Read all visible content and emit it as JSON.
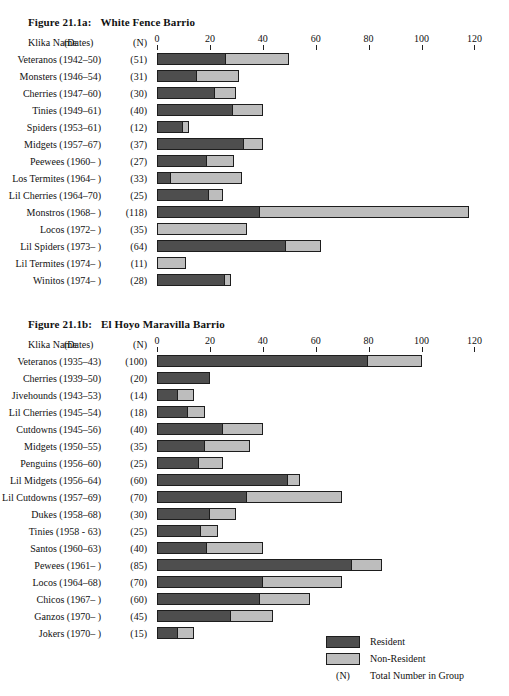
{
  "legend": {
    "resident_label": "Resident",
    "nonresident_label": "Non-Resident",
    "n_key": "(N)",
    "n_label": "Total Number in Group",
    "resident_color": "#4e4e4e",
    "nonresident_color": "#bdbdbd"
  },
  "columns": {
    "name": "Klika Name",
    "dates": "(Dates)",
    "n": "(N)"
  },
  "axis": {
    "ticks": [
      0,
      20,
      40,
      60,
      80,
      100,
      120
    ],
    "min": 0,
    "max": 130
  },
  "chart_data": [
    {
      "type": "bar",
      "orientation": "horizontal",
      "stacked": true,
      "title": "Figure 21.1a:   White Fence Barrio",
      "title_number": "Figure 21.1a:",
      "title_text": "White Fence Barrio",
      "xlabel": "",
      "ylabel": "Klika Name",
      "xlim": [
        0,
        130
      ],
      "xticks": [
        0,
        20,
        40,
        60,
        80,
        100,
        120
      ],
      "grid": false,
      "legend_position": "bottom-right",
      "series": [
        {
          "name": "Resident",
          "color": "#4e4e4e",
          "values": [
            26,
            15,
            22,
            29,
            10,
            33,
            19,
            5,
            20,
            39,
            0,
            49,
            0,
            26
          ]
        },
        {
          "name": "Non-Resident",
          "color": "#bdbdbd",
          "values": [
            24,
            16,
            8,
            11,
            2,
            7,
            10,
            27,
            5,
            79,
            34,
            13,
            11,
            2
          ]
        }
      ],
      "rows": [
        {
          "name": "Veteranos",
          "dates": "(1942–50)",
          "n": "(51)",
          "resident": 26,
          "nonresident": 24
        },
        {
          "name": "Monsters",
          "dates": "(1946–54)",
          "n": "(31)",
          "resident": 15,
          "nonresident": 16
        },
        {
          "name": "Cherries",
          "dates": "(1947–60)",
          "n": "(30)",
          "resident": 22,
          "nonresident": 8
        },
        {
          "name": "Tinies",
          "dates": "(1949–61)",
          "n": "(40)",
          "resident": 29,
          "nonresident": 11
        },
        {
          "name": "Spiders",
          "dates": "(1953–61)",
          "n": "(12)",
          "resident": 10,
          "nonresident": 2
        },
        {
          "name": "Midgets",
          "dates": "(1957–67)",
          "n": "(37)",
          "resident": 33,
          "nonresident": 7
        },
        {
          "name": "Peewees",
          "dates": "(1960– )",
          "n": "(27)",
          "resident": 19,
          "nonresident": 10
        },
        {
          "name": "Los Termites",
          "dates": "(1964– )",
          "n": "(33)",
          "resident": 5,
          "nonresident": 27
        },
        {
          "name": "Lil Cherries",
          "dates": "(1964–70)",
          "n": "(25)",
          "resident": 20,
          "nonresident": 5
        },
        {
          "name": "Monstros",
          "dates": "(1968– )",
          "n": "(118)",
          "resident": 39,
          "nonresident": 79
        },
        {
          "name": "Locos",
          "dates": "(1972– )",
          "n": "(35)",
          "resident": 0,
          "nonresident": 34
        },
        {
          "name": "Lil Spiders",
          "dates": "(1973– )",
          "n": "(64)",
          "resident": 49,
          "nonresident": 13
        },
        {
          "name": "Lil Termites",
          "dates": "(1974– )",
          "n": "(11)",
          "resident": 0,
          "nonresident": 11
        },
        {
          "name": "Winitos",
          "dates": "(1974– )",
          "n": "(28)",
          "resident": 26,
          "nonresident": 2
        }
      ]
    },
    {
      "type": "bar",
      "orientation": "horizontal",
      "stacked": true,
      "title": "Figure 21.1b:   El Hoyo Maravilla Barrio",
      "title_number": "Figure 21.1b:",
      "title_text": "El Hoyo Maravilla Barrio",
      "xlabel": "",
      "ylabel": "Klika Name",
      "xlim": [
        0,
        130
      ],
      "xticks": [
        0,
        20,
        40,
        60,
        80,
        100,
        120
      ],
      "grid": false,
      "legend_position": "bottom-right",
      "series": [
        {
          "name": "Resident",
          "color": "#4e4e4e",
          "values": [
            80,
            20,
            8,
            12,
            25,
            18,
            16,
            50,
            34,
            20,
            17,
            19,
            74,
            40,
            39,
            28,
            8
          ]
        },
        {
          "name": "Non-Resident",
          "color": "#bdbdbd",
          "values": [
            20,
            0,
            6,
            6,
            15,
            17,
            9,
            4,
            36,
            10,
            6,
            21,
            11,
            30,
            19,
            16,
            6
          ]
        }
      ],
      "rows": [
        {
          "name": "Veteranos",
          "dates": "(1935–43)",
          "n": "(100)",
          "resident": 80,
          "nonresident": 20
        },
        {
          "name": "Cherries",
          "dates": "(1939–50)",
          "n": "(20)",
          "resident": 20,
          "nonresident": 0
        },
        {
          "name": "Jivehounds",
          "dates": "(1943–53)",
          "n": "(14)",
          "resident": 8,
          "nonresident": 6
        },
        {
          "name": "Lil Cherries",
          "dates": "(1945–54)",
          "n": "(18)",
          "resident": 12,
          "nonresident": 6
        },
        {
          "name": "Cutdowns",
          "dates": "(1945–56)",
          "n": "(40)",
          "resident": 25,
          "nonresident": 15
        },
        {
          "name": "Midgets",
          "dates": "(1950–55)",
          "n": "(35)",
          "resident": 18,
          "nonresident": 17
        },
        {
          "name": "Penguins",
          "dates": "(1956–60)",
          "n": "(25)",
          "resident": 16,
          "nonresident": 9
        },
        {
          "name": "Lil Midgets",
          "dates": "(1956–64)",
          "n": "(60)",
          "resident": 50,
          "nonresident": 4
        },
        {
          "name": "Lil Cutdowns",
          "dates": "(1957–69)",
          "n": "(70)",
          "resident": 34,
          "nonresident": 36
        },
        {
          "name": "Dukes",
          "dates": "(1958–68)",
          "n": "(30)",
          "resident": 20,
          "nonresident": 10
        },
        {
          "name": "Tinies",
          "dates": "(1958 - 63)",
          "n": "(25)",
          "resident": 17,
          "nonresident": 6
        },
        {
          "name": "Santos",
          "dates": "(1960–63)",
          "n": "(40)",
          "resident": 19,
          "nonresident": 21
        },
        {
          "name": "Pewees",
          "dates": "(1961– )",
          "n": "(85)",
          "resident": 74,
          "nonresident": 11
        },
        {
          "name": "Locos",
          "dates": "(1964–68)",
          "n": "(70)",
          "resident": 40,
          "nonresident": 30
        },
        {
          "name": "Chicos",
          "dates": "(1967– )",
          "n": "(60)",
          "resident": 39,
          "nonresident": 19
        },
        {
          "name": "Ganzos",
          "dates": "(1970– )",
          "n": "(45)",
          "resident": 28,
          "nonresident": 16
        },
        {
          "name": "Jokers",
          "dates": "(1970– )",
          "n": "(15)",
          "resident": 8,
          "nonresident": 6
        }
      ]
    }
  ]
}
